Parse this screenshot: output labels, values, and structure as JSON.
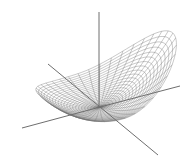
{
  "chart_data": {
    "type": "surface-wireframe",
    "title": "",
    "xlabel": "",
    "ylabel": "",
    "zlabel": "",
    "grid": false,
    "legend": null,
    "mesh": {
      "radial_lines": 40,
      "rings": 22,
      "r_max": 1.0,
      "line_color": "#707070"
    },
    "projection": {
      "center": [
        100,
        107
      ],
      "scale": 78
    },
    "axes": [
      {
        "name": "z-axis",
        "from": [
          99,
          12
        ],
        "to": [
          99,
          107
        ]
      },
      {
        "name": "x-axis-left",
        "from": [
          22,
          128
        ],
        "to": [
          100,
          107
        ]
      },
      {
        "name": "x-axis-right",
        "from": [
          100,
          107
        ],
        "to": [
          180,
          86
        ]
      },
      {
        "name": "y-axis-back",
        "from": [
          48,
          64
        ],
        "to": [
          100,
          107
        ]
      },
      {
        "name": "y-axis-front",
        "from": [
          100,
          107
        ],
        "to": [
          158,
          155
        ]
      }
    ],
    "axis_color": "#6e6e6e"
  }
}
